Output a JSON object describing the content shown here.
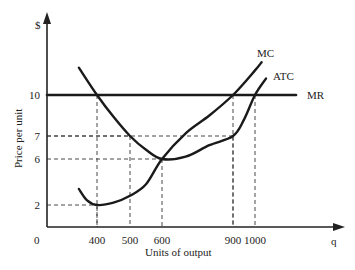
{
  "chart_data": {
    "type": "line",
    "title": "",
    "xlabel": "Units of output",
    "ylabel": "Price per unit",
    "x_axis_end_label": "q",
    "y_axis_end_label": "$",
    "origin_label": "0",
    "xlim": [
      250,
      1350
    ],
    "ylim": [
      -3,
      15
    ],
    "x_ticks": [
      {
        "value": 400,
        "label": "400"
      },
      {
        "value": 500,
        "label": "500"
      },
      {
        "value": 600,
        "label": "600"
      },
      {
        "value": 900,
        "label": "900"
      },
      {
        "value": 1000,
        "label": "1000"
      }
    ],
    "y_ticks": [
      {
        "value": 2,
        "label": "2"
      },
      {
        "value": 6,
        "label": "6"
      },
      {
        "value": 7,
        "label": "7"
      },
      {
        "value": 10,
        "label": "10"
      }
    ],
    "series": [
      {
        "name": "MC",
        "label": "MC",
        "points": [
          [
            345,
            3.4
          ],
          [
            370,
            2.4
          ],
          [
            400,
            2.0
          ],
          [
            450,
            2.2
          ],
          [
            500,
            2.8
          ],
          [
            550,
            3.8
          ],
          [
            600,
            6.0
          ],
          [
            700,
            7.2
          ],
          [
            800,
            8.5
          ],
          [
            900,
            10.0
          ],
          [
            1000,
            11.8
          ],
          [
            1030,
            12.4
          ]
        ]
      },
      {
        "name": "ATC",
        "label": "ATC",
        "points": [
          [
            345,
            12.0
          ],
          [
            400,
            10.0
          ],
          [
            450,
            8.4
          ],
          [
            500,
            7.0
          ],
          [
            550,
            6.4
          ],
          [
            600,
            6.0
          ],
          [
            700,
            6.1
          ],
          [
            800,
            6.6
          ],
          [
            900,
            7.0
          ],
          [
            950,
            8.2
          ],
          [
            1000,
            10.0
          ],
          [
            1050,
            11.2
          ]
        ]
      },
      {
        "name": "MR",
        "label": "MR",
        "points": [
          [
            250,
            10
          ],
          [
            1200,
            10
          ]
        ]
      }
    ],
    "guides": [
      {
        "x": 400,
        "y": 10
      },
      {
        "x": 400,
        "y": 2
      },
      {
        "x": 500,
        "y": 7
      },
      {
        "x": 600,
        "y": 6
      },
      {
        "x": 900,
        "y": 10
      },
      {
        "x": 900,
        "y": 7
      },
      {
        "x": 1000,
        "y": 10
      }
    ],
    "grid": false,
    "legend": "none (curves labeled inline at right ends)"
  }
}
